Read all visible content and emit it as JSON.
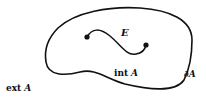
{
  "diagram": {
    "type": "set-boundary-illustration",
    "labels": {
      "curve": "E",
      "interior_word": "int",
      "interior_set": "A",
      "boundary": "∂A",
      "exterior_word": "ext",
      "exterior_set": "A"
    },
    "elements": [
      {
        "kind": "closed-curve",
        "name": "boundary ∂A"
      },
      {
        "kind": "open-curve",
        "name": "E",
        "endpoints": "dots at both ends"
      }
    ],
    "colors": {
      "stroke": "#111111",
      "background": "#ffffff"
    }
  }
}
